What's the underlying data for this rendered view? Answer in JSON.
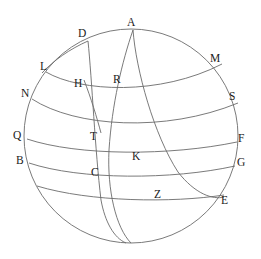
{
  "figure": {
    "background_color": "#ffffff",
    "stroke_color": "#6b6b6b",
    "label_color": "#1a1a1a",
    "stroke_width": 0.9,
    "width": 261,
    "height": 259
  },
  "sphere": {
    "name": "outer-circle",
    "cx": 131,
    "cy": 136,
    "r": 107
  },
  "labels": [
    {
      "id": "A",
      "text": "A",
      "x": 127,
      "y": 17
    },
    {
      "id": "D",
      "text": "D",
      "x": 78,
      "y": 28
    },
    {
      "id": "L",
      "text": "L",
      "x": 40,
      "y": 61
    },
    {
      "id": "M",
      "text": "M",
      "x": 210,
      "y": 53
    },
    {
      "id": "H",
      "text": "H",
      "x": 74,
      "y": 78
    },
    {
      "id": "R",
      "text": "R",
      "x": 113,
      "y": 74
    },
    {
      "id": "N",
      "text": "N",
      "x": 21,
      "y": 88
    },
    {
      "id": "S",
      "text": "S",
      "x": 229,
      "y": 91
    },
    {
      "id": "Q",
      "text": "Q",
      "x": 13,
      "y": 130
    },
    {
      "id": "T",
      "text": "T",
      "x": 90,
      "y": 131
    },
    {
      "id": "F",
      "text": "F",
      "x": 238,
      "y": 133
    },
    {
      "id": "B",
      "text": "B",
      "x": 16,
      "y": 155
    },
    {
      "id": "K",
      "text": "K",
      "x": 132,
      "y": 151
    },
    {
      "id": "G",
      "text": "G",
      "x": 237,
      "y": 157
    },
    {
      "id": "C",
      "text": "C",
      "x": 91,
      "y": 167
    },
    {
      "id": "Z",
      "text": "Z",
      "x": 154,
      "y": 189
    },
    {
      "id": "E",
      "text": "E",
      "x": 221,
      "y": 195
    }
  ],
  "arcs": [
    {
      "id": "arc-L-M",
      "name": "latitude-arc-L-to-M",
      "from": "L",
      "to": "M",
      "path": "M 46,72 C 80,92 160,96 222,64"
    },
    {
      "id": "arc-N-S",
      "name": "latitude-arc-N-to-S",
      "from": "N",
      "to": "S",
      "path": "M 32,99 C 75,127 165,133 238,103"
    },
    {
      "id": "arc-Q-F",
      "name": "latitude-arc-Q-to-F",
      "from": "Q",
      "to": "F",
      "path": "M 27,139 C 78,156 170,156 237,142"
    },
    {
      "id": "arc-B-G",
      "name": "latitude-arc-B-to-G",
      "from": "B",
      "to": "G",
      "path": "M 29,163 C 80,180 172,180 235,166"
    },
    {
      "id": "arc-C-E",
      "name": "latitude-arc-C-to-E",
      "from": "C-side",
      "to": "E",
      "path": "M 37,186 C 90,202 172,203 224,195"
    },
    {
      "id": "arc-D-bottom",
      "name": "meridian-arc-D-through-T-C",
      "from": "D",
      "to": "bottom",
      "path": "M 88,41 C 92,80 95,150 101,200 C 105,222 114,238 126,243"
    },
    {
      "id": "arc-A-bottom",
      "name": "meridian-arc-A-through-R-T-bottom",
      "from": "A",
      "to": "bottom",
      "path": "M 133,30 C 122,62 112,104 109,150 C 107,190 116,228 131,243"
    },
    {
      "id": "arc-A-E",
      "name": "great-circle-arc-A-through-R-K-Z-to-E",
      "from": "A",
      "to": "E",
      "path": "M 133,30 C 136,70 154,135 178,172 C 195,194 213,200 224,197"
    },
    {
      "id": "arc-D-L",
      "name": "short-arc-D-to-L-edge",
      "from": "D",
      "to": "L",
      "path": "M 88,41 C 70,49 54,60 42,73"
    },
    {
      "id": "arc-H-T",
      "name": "short-arc-H-to-T",
      "from": "H",
      "to": "T",
      "path": "M 84,80 C 91,98 97,118 101,133"
    }
  ]
}
